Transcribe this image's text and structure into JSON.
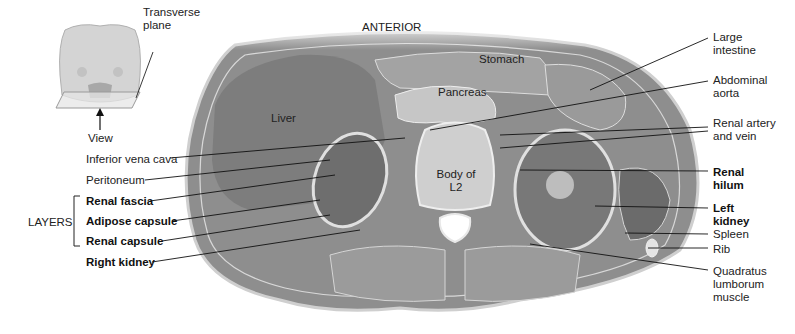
{
  "figure": {
    "orientation_label": "ANTERIOR",
    "inset": {
      "plane_label": "Transverse plane",
      "view_label": "View"
    },
    "organ_labels": {
      "stomach": "Stomach",
      "pancreas": "Pancreas",
      "liver": "Liver",
      "vertebra": "Body of L2"
    },
    "left_labels": [
      {
        "id": "ivc",
        "text": "Inferior vena cava",
        "bold": false
      },
      {
        "id": "peritoneum",
        "text": "Peritoneum",
        "bold": false
      },
      {
        "id": "renal-fascia",
        "text": "Renal fascia",
        "bold": true
      },
      {
        "id": "adipose-capsule",
        "text": "Adipose capsule",
        "bold": true
      },
      {
        "id": "renal-capsule",
        "text": "Renal capsule",
        "bold": true
      },
      {
        "id": "right-kidney",
        "text": "Right kidney",
        "bold": true
      }
    ],
    "layers_bracket_label": "LAYERS",
    "right_labels": [
      {
        "id": "large-intestine",
        "text": "Large intestine",
        "bold": false
      },
      {
        "id": "abdominal-aorta",
        "text": "Abdominal aorta",
        "bold": false
      },
      {
        "id": "renal-artery-vein",
        "text": "Renal artery and vein",
        "bold": false
      },
      {
        "id": "renal-hilum",
        "text": "Renal hilum",
        "bold": true
      },
      {
        "id": "left-kidney",
        "text": "Left kidney",
        "bold": true
      },
      {
        "id": "spleen",
        "text": "Spleen",
        "bold": false
      },
      {
        "id": "rib",
        "text": "Rib",
        "bold": false
      },
      {
        "id": "quadratus",
        "text": "Quadratus lumborum muscle",
        "bold": false
      }
    ]
  }
}
